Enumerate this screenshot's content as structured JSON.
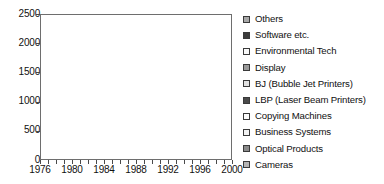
{
  "chart_data": {
    "type": "area",
    "stacked": true,
    "title": "",
    "xlabel": "",
    "ylabel": "",
    "xlim": [
      1976,
      2000
    ],
    "ylim": [
      0,
      2500
    ],
    "grid": false,
    "legend_position": "right",
    "x": [
      1976,
      1977,
      1978,
      1979,
      1980,
      1981,
      1982,
      1983,
      1984,
      1985,
      1986,
      1987,
      1988,
      1989,
      1990,
      1991,
      1992,
      1993,
      1994,
      1995,
      1996,
      1997,
      1998,
      1999,
      2000
    ],
    "xticks": [
      1976,
      1980,
      1984,
      1988,
      1992,
      1996,
      2000
    ],
    "yticks": [
      0,
      500,
      1000,
      1500,
      2000,
      2500
    ],
    "ytick_labels": [
      "0",
      "500",
      "1000",
      "1500",
      "2000",
      "2500"
    ],
    "xtick_labels": [
      "1976",
      "1980",
      "1984",
      "1988",
      "1992",
      "1996",
      "2000"
    ],
    "series": [
      {
        "name": "Cameras",
        "color": "#b4b4b4",
        "values": [
          95,
          100,
          108,
          118,
          128,
          135,
          140,
          150,
          158,
          150,
          145,
          150,
          175,
          185,
          190,
          185,
          180,
          175,
          175,
          180,
          195,
          215,
          235,
          260,
          290
        ]
      },
      {
        "name": "Optical Products",
        "color": "#8a8a8a",
        "values": [
          18,
          20,
          22,
          25,
          30,
          34,
          38,
          44,
          52,
          56,
          60,
          68,
          82,
          95,
          102,
          100,
          96,
          92,
          94,
          100,
          112,
          128,
          140,
          152,
          168
        ]
      },
      {
        "name": "Business Systems",
        "color": "#f2f2f2",
        "values": [
          8,
          10,
          12,
          16,
          22,
          28,
          34,
          42,
          52,
          56,
          62,
          72,
          92,
          105,
          112,
          110,
          106,
          104,
          108,
          118,
          132,
          152,
          168,
          188,
          210
        ]
      },
      {
        "name": "Copying Machines",
        "color": "#fcfcfc",
        "values": [
          40,
          48,
          60,
          80,
          110,
          140,
          170,
          205,
          250,
          265,
          275,
          300,
          360,
          400,
          425,
          420,
          410,
          400,
          410,
          440,
          480,
          540,
          590,
          640,
          700
        ]
      },
      {
        "name": "LBP (Laser Beam Printers)",
        "color": "#4a4a4a",
        "values": [
          0,
          0,
          0,
          2,
          5,
          10,
          16,
          24,
          36,
          44,
          52,
          66,
          92,
          112,
          126,
          128,
          126,
          124,
          132,
          148,
          172,
          205,
          235,
          268,
          305
        ]
      },
      {
        "name": "BJ (Bubble Jet Printers)",
        "color": "#e2e2e2",
        "values": [
          0,
          0,
          0,
          0,
          0,
          0,
          0,
          0,
          2,
          6,
          10,
          18,
          34,
          50,
          62,
          66,
          66,
          66,
          74,
          88,
          108,
          136,
          162,
          192,
          225
        ]
      },
      {
        "name": "Display",
        "color": "#9a9a9a",
        "values": [
          0,
          0,
          0,
          0,
          0,
          0,
          2,
          4,
          8,
          12,
          16,
          24,
          40,
          54,
          64,
          66,
          64,
          62,
          68,
          78,
          94,
          115,
          134,
          155,
          178
        ]
      },
      {
        "name": "Environmental Tech",
        "color": "#fafafa",
        "values": [
          0,
          0,
          0,
          0,
          0,
          0,
          0,
          0,
          2,
          4,
          6,
          10,
          18,
          26,
          32,
          34,
          34,
          34,
          38,
          44,
          54,
          66,
          78,
          90,
          104
        ]
      },
      {
        "name": "Software etc.",
        "color": "#3c3c3c",
        "values": [
          0,
          0,
          0,
          0,
          0,
          0,
          0,
          0,
          0,
          2,
          4,
          8,
          16,
          24,
          30,
          32,
          32,
          32,
          36,
          42,
          52,
          64,
          76,
          88,
          102
        ]
      },
      {
        "name": "Others",
        "color": "#a8a8a8",
        "values": [
          4,
          5,
          6,
          8,
          10,
          12,
          14,
          18,
          22,
          24,
          26,
          32,
          46,
          58,
          66,
          68,
          66,
          64,
          70,
          80,
          96,
          118,
          140,
          162,
          188
        ]
      }
    ],
    "legend_entries": [
      {
        "label": "Others",
        "color": "#a8a8a8"
      },
      {
        "label": "Software etc.",
        "color": "#3c3c3c"
      },
      {
        "label": "Environmental Tech",
        "color": "#fafafa"
      },
      {
        "label": "Display",
        "color": "#9a9a9a"
      },
      {
        "label": "BJ (Bubble Jet Printers)",
        "color": "#e2e2e2"
      },
      {
        "label": "LBP (Laser Beam Printers)",
        "color": "#4a4a4a"
      },
      {
        "label": "Copying Machines",
        "color": "#fcfcfc"
      },
      {
        "label": "Business Systems",
        "color": "#f2f2f2"
      },
      {
        "label": "Optical Products",
        "color": "#8a8a8a"
      },
      {
        "label": "Cameras",
        "color": "#b4b4b4"
      }
    ]
  }
}
